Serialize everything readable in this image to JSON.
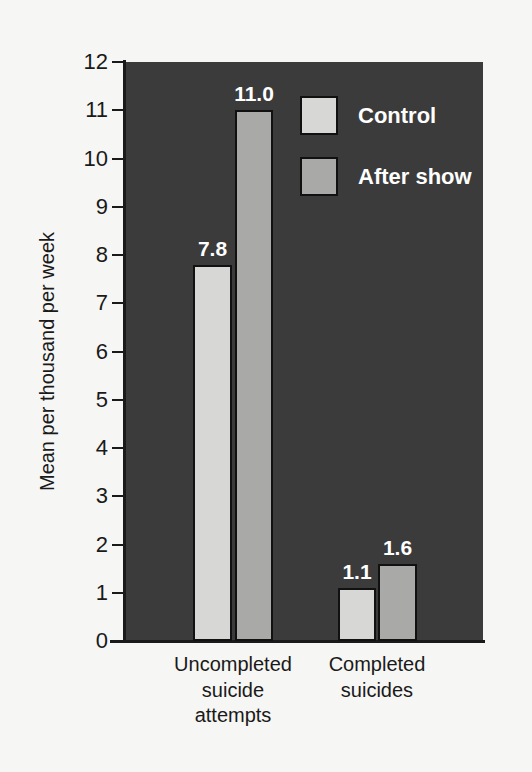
{
  "chart_data": {
    "type": "bar",
    "title": "",
    "xlabel": "",
    "ylabel": "Mean per thousand per week",
    "ylim": [
      0,
      12
    ],
    "ytick_labels": [
      "12",
      "11",
      "10",
      "9",
      "8",
      "7",
      "6",
      "5",
      "4",
      "3",
      "2",
      "1",
      "0"
    ],
    "yticks": [
      12,
      11,
      10,
      9,
      8,
      7,
      6,
      5,
      4,
      3,
      2,
      1,
      0
    ],
    "grid": false,
    "legend_position": "upper right (inside plot)",
    "categories": [
      "Uncompleted suicide attempts",
      "Completed suicides"
    ],
    "category_lines": [
      [
        "Uncompleted",
        "suicide",
        "attempts"
      ],
      [
        "Completed",
        "suicides"
      ]
    ],
    "series": [
      {
        "name": "Control",
        "values": [
          7.8,
          1.1
        ],
        "labels": [
          "7.8",
          "1.1"
        ],
        "color": "#d7d7d5"
      },
      {
        "name": "After show",
        "values": [
          11.0,
          1.6
        ],
        "labels": [
          "11.0",
          "1.6"
        ],
        "color": "#a9a9a7"
      }
    ]
  },
  "colors": {
    "page_background": "#f6f6f4",
    "plot_background": "#3b3b3b",
    "axis": "#1a1a1a",
    "bar_control": "#d7d7d5",
    "bar_after_show": "#a9a9a7",
    "value_label": "#ffffff"
  },
  "legend": {
    "items": [
      {
        "label": "Control",
        "swatch": "control"
      },
      {
        "label": "After show",
        "swatch": "after"
      }
    ]
  }
}
